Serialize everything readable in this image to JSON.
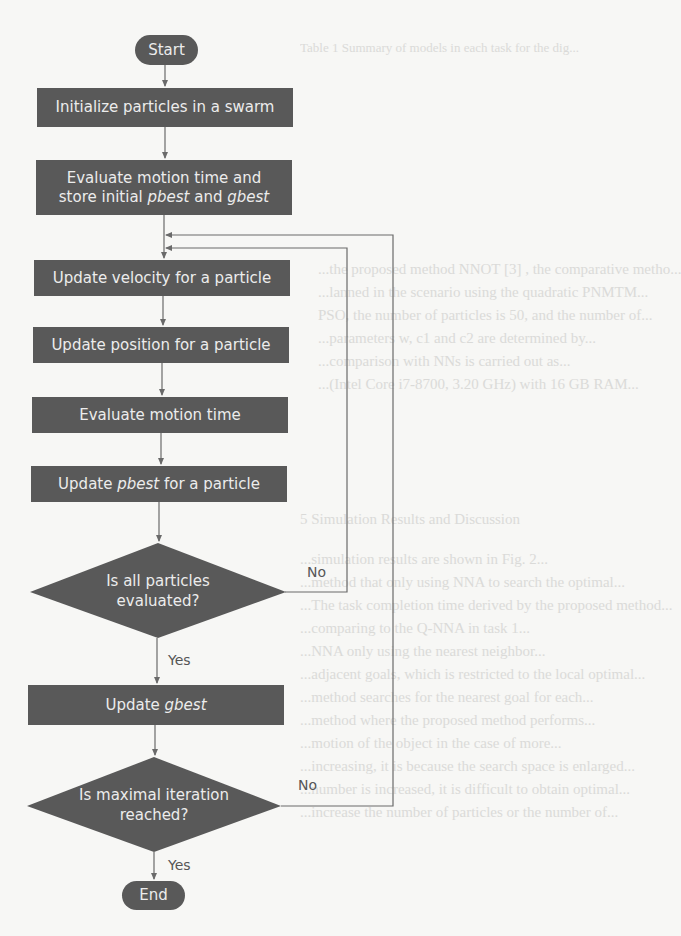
{
  "background": {
    "lines": [
      "Table 1 Summary of models in each task for the dig...",
      "...the proposed method NNOT [3] , the comparative metho...",
      "...lanned in the scenario using the quadratic PNMTM...",
      "PSO, the number of particles is 50, and the number of...",
      "...parameters w, c1 and c2 are determined by...",
      "...comparison with NNs is carried out as...",
      "...(Intel Core i7-8700, 3.20 GHz) with 16 GB RAM...",
      "5 Simulation Results and Discussion",
      "...simulation results are shown in Fig. 2...",
      "...method that only using NNA to search the optimal...",
      "...The task completion time derived by the proposed method...",
      "...comparing to the Q-NNA in task 1...",
      "...NNA only using the nearest neighbor...",
      "...adjacent goals, which is restricted to the local optimal...",
      "...method searches for the nearest goal for each...",
      "...method where the proposed method performs...",
      "...motion of the object in the case of more...",
      "...increasing, it is because the search space is enlarged...",
      "...number is increased, it is difficult to obtain optimal...",
      "...increase the number of particles or the number of..."
    ]
  },
  "flowchart": {
    "start": "Start",
    "steps": [
      {
        "id": "init",
        "text": "Initialize particles in a swarm"
      },
      {
        "id": "eval_init",
        "line1": "Evaluate motion time and",
        "line2_pre": "store initial ",
        "line2_pbest": "pbest",
        "line2_mid": " and ",
        "line2_gbest": "gbest"
      },
      {
        "id": "velocity",
        "text": "Update velocity for a particle"
      },
      {
        "id": "position",
        "text": "Update position for a particle"
      },
      {
        "id": "eval",
        "text": "Evaluate motion time"
      },
      {
        "id": "pbest",
        "pre": "Update ",
        "em": "pbest",
        "post": " for a particle"
      },
      {
        "id": "gbest",
        "pre": "Update ",
        "em": "gbest"
      }
    ],
    "decisions": [
      {
        "id": "all_evaluated",
        "line1": "Is all particles",
        "line2": "evaluated?",
        "no": "No",
        "yes": "Yes"
      },
      {
        "id": "max_iter",
        "line1": "Is maximal iteration",
        "line2": "reached?",
        "no": "No",
        "yes": "Yes"
      }
    ],
    "end": "End",
    "colors": {
      "node_fill": "#595959",
      "node_text": "#ececec",
      "line": "#6a6a6a"
    }
  }
}
